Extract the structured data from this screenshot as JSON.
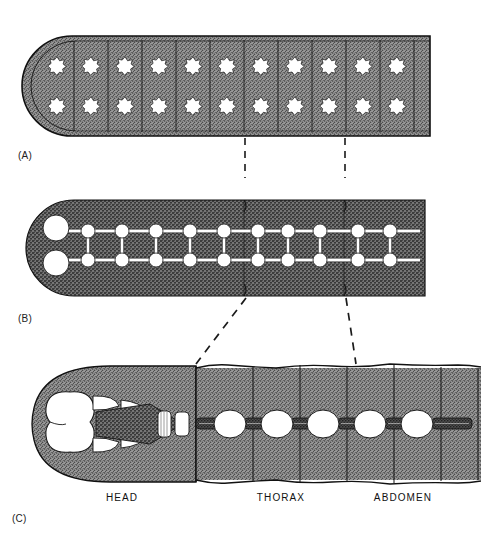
{
  "figure": {
    "type": "biological-diagram",
    "background_color": "#ffffff",
    "ink_color": "#111111",
    "body_fill_color": "#8d8d8d",
    "ganglion_fill_color": "#ffffff",
    "connective_fill_color": "#4a4a4a"
  },
  "panels": [
    {
      "id": "A",
      "label": "(A)",
      "label_x": 18,
      "label_y": 150,
      "stage": "primitive-dispersed-ganglia",
      "segment_numbers": [
        "1",
        "2",
        "3",
        "4",
        "5",
        "6",
        "7",
        "8",
        "9",
        "10",
        "11"
      ],
      "number_row_y": 18,
      "number_x": [
        57,
        91,
        125,
        159,
        193,
        227,
        261,
        295,
        329,
        363,
        397
      ],
      "body": {
        "x": 22,
        "y": 36,
        "width": 408,
        "height": 100,
        "round_left": true
      },
      "ganglia_rows_y": [
        66,
        106
      ],
      "ganglia_x": [
        57,
        91,
        125,
        159,
        193,
        227,
        261,
        295,
        329,
        363,
        397
      ],
      "ganglion_shape": "star-blob",
      "ganglion_radius": 9
    },
    {
      "id": "B",
      "label": "(B)",
      "label_x": 18,
      "label_y": 313,
      "stage": "ladder-type-nerve-cord",
      "segment_numbers": [
        "1",
        "2",
        "3",
        "4",
        "5",
        "6",
        "7",
        "8",
        "9",
        "10",
        "11"
      ],
      "number_row_y": 182,
      "number_x": [
        54,
        88,
        122,
        156,
        190,
        224,
        258,
        288,
        320,
        358,
        390
      ],
      "body": {
        "x": 26,
        "y": 200,
        "width": 399,
        "height": 96,
        "round_left": true
      },
      "cord_rows_y": [
        231,
        260
      ],
      "brain_x": 56,
      "brain_radius": 13,
      "ganglia_x": [
        88,
        122,
        156,
        190,
        224,
        258,
        288,
        320,
        358,
        390
      ],
      "ganglion_radius": 7,
      "commissure_x": [
        88,
        122,
        156,
        190,
        224,
        258,
        288,
        320,
        358,
        390
      ]
    },
    {
      "id": "C",
      "label": "(C)",
      "label_x": 12,
      "label_y": 513,
      "stage": "fused-condensed-insect-cns",
      "segment_numbers": [
        "1",
        "2",
        "3",
        "4",
        "5",
        "6",
        "7",
        "8",
        "9",
        "10",
        "11"
      ],
      "number_row_y": 348,
      "number_x": [
        62,
        88,
        110,
        152,
        172,
        190,
        234,
        284,
        330,
        382,
        428
      ],
      "body": {
        "x": 30,
        "y": 362,
        "width": 451,
        "height": 125
      },
      "cord_axis_y": 424,
      "brain": {
        "cx": 70,
        "cy": 424,
        "rx": 22,
        "ry": 34
      },
      "subesophageal_x": [
        100,
        122,
        144
      ],
      "small_ganglia_x": [
        165,
        180
      ],
      "fused_ganglia_x": [
        230,
        277,
        323,
        370,
        417
      ],
      "fused_ganglion_rx": 16,
      "fused_ganglion_ry": 14,
      "connective_x": [
        200,
        253,
        300,
        347,
        394,
        441
      ]
    }
  ],
  "region_labels": [
    {
      "text": "HEAD",
      "x": 122,
      "y": 492
    },
    {
      "text": "THORAX",
      "x": 281,
      "y": 492
    },
    {
      "text": "ABDOMEN",
      "x": 403,
      "y": 492
    }
  ],
  "connectors": {
    "a_to_b": [
      {
        "x1": 245,
        "y1": 138,
        "x2": 245,
        "y2": 178
      },
      {
        "x1": 345,
        "y1": 138,
        "x2": 345,
        "y2": 178
      }
    ],
    "b_to_c": [
      {
        "x1": 246,
        "y1": 298,
        "x2": 196,
        "y2": 362
      },
      {
        "x1": 346,
        "y1": 298,
        "x2": 356,
        "y2": 362
      }
    ],
    "style": "dashed",
    "color": "#1a1a1a"
  }
}
